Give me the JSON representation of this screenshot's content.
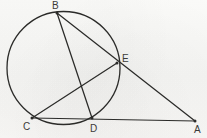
{
  "figure": {
    "kind": "euclidean-geometry-diagram",
    "background_color": "#f7f7f5",
    "stroke_color": "#2b2b29",
    "label_color": "#3a3a38",
    "canvas": {
      "width": 207,
      "height": 138
    }
  },
  "circle": {
    "name": "main-circle",
    "cx": 63.5,
    "cy": 68.0,
    "r": 56.5,
    "stroke_width": 1.3
  },
  "points": [
    {
      "id": "B",
      "label": "B",
      "x": 57.0,
      "y": 13.0,
      "label_x": 52.0,
      "label_y": 1.0,
      "on_circle": true,
      "dot": true
    },
    {
      "id": "E",
      "label": "E",
      "x": 117.0,
      "y": 63.0,
      "label_x": 122.0,
      "label_y": 54.0,
      "on_circle": true,
      "dot": true
    },
    {
      "id": "C",
      "label": "C",
      "x": 32.0,
      "y": 118.0,
      "label_x": 23.0,
      "label_y": 122.0,
      "on_circle": true,
      "dot": true
    },
    {
      "id": "D",
      "label": "D",
      "x": 92.0,
      "y": 118.0,
      "label_x": 90.0,
      "label_y": 124.0,
      "on_circle": true,
      "dot": true
    },
    {
      "id": "A",
      "label": "A",
      "x": 195.0,
      "y": 121.0,
      "label_x": 194.0,
      "label_y": 125.0,
      "on_circle": false,
      "dot": true
    }
  ],
  "segments": [
    {
      "id": "B-D",
      "name": "chord-b-d",
      "from": "B",
      "to": "D",
      "stroke_width": 1.25
    },
    {
      "id": "B-A",
      "name": "secant-b-e-a",
      "from": "B",
      "to": "A",
      "stroke_width": 1.25,
      "passes_through": "E"
    },
    {
      "id": "C-E",
      "name": "chord-c-e",
      "from": "C",
      "to": "E",
      "stroke_width": 1.25
    },
    {
      "id": "C-A",
      "name": "secant-c-d-a",
      "from": "C",
      "to": "A",
      "stroke_width": 1.25,
      "passes_through": "D"
    }
  ],
  "labels": {
    "B": "B",
    "C": "C",
    "D": "D",
    "E": "E",
    "A": "A"
  }
}
